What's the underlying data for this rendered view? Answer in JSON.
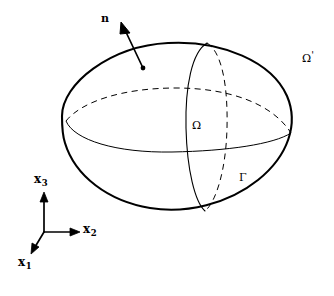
{
  "figure": {
    "background_color": "#ffffff",
    "stroke_color": "#000000",
    "width": 334,
    "height": 296
  },
  "labels": {
    "normal_vector": "n",
    "exterior_domain": "Ω",
    "exterior_domain_prime": "'",
    "interior_domain": "Ω",
    "boundary_surface": "Γ",
    "axis_x1_base": "x",
    "axis_x1_sub": "1",
    "axis_x2_base": "x",
    "axis_x2_sub": "2",
    "axis_x3_base": "x",
    "axis_x3_sub": "3"
  },
  "geometry": {
    "ellipsoid": {
      "center_x": 177,
      "center_y": 127,
      "semi_axis_major": 115,
      "semi_axis_minor": 84,
      "rotation_deg": -4,
      "stroke_width": 2.0
    },
    "equator": {
      "left_x": 66,
      "left_y": 121,
      "right_x": 291,
      "right_y": 133,
      "back_arc_style": "dashed",
      "front_arc_style": "solid",
      "stroke_width": 1.0
    },
    "meridian": {
      "top_x": 207,
      "top_y": 43,
      "bottom_x": 205,
      "bottom_y": 211,
      "front_arc_style": "solid",
      "back_arc_style": "dashed",
      "stroke_width": 1.0
    },
    "normal_arrow": {
      "tail_x": 143,
      "tail_y": 68,
      "head_x": 122,
      "head_y": 24,
      "stroke_width": 1.6
    },
    "axes_origin": {
      "x": 44,
      "y": 232
    },
    "axis_x3_tip": {
      "x": 44,
      "y": 193
    },
    "axis_x2_tip": {
      "x": 79,
      "y": 232
    },
    "axis_x1_tip": {
      "x": 32,
      "y": 252
    }
  },
  "label_positions": {
    "normal_vector": {
      "x": 101,
      "y": 14
    },
    "exterior_domain": {
      "x": 302,
      "y": 50
    },
    "interior_domain": {
      "x": 192,
      "y": 119
    },
    "boundary_surface": {
      "x": 238,
      "y": 171
    },
    "axis_x3": {
      "x": 35,
      "y": 174
    },
    "axis_x2": {
      "x": 83,
      "y": 223
    },
    "axis_x1": {
      "x": 19,
      "y": 256
    }
  }
}
